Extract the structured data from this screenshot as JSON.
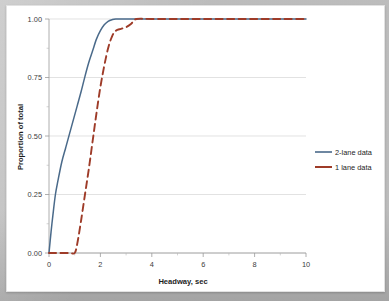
{
  "chart_data": {
    "type": "line",
    "title": "",
    "xlabel": "Headway, sec",
    "ylabel": "Proportion of total",
    "xlim": [
      0,
      10
    ],
    "ylim": [
      0,
      1.0
    ],
    "xticks": [
      "0",
      "2",
      "4",
      "6",
      "8",
      "10"
    ],
    "xtick_values": [
      0,
      2,
      4,
      6,
      8,
      10
    ],
    "yticks": [
      "0.00",
      "0.25",
      "0.50",
      "0.75",
      "1.00"
    ],
    "ytick_values": [
      0,
      0.25,
      0.5,
      0.75,
      1.0
    ],
    "grid": "horizontal",
    "legend_position": "right",
    "colors": {
      "series_2lane": "#4a6a8a",
      "series_1lane": "#9e3b28",
      "gridline": "#d6d6d6",
      "axis": "#9a9a9a",
      "plot_background": "#ffffff",
      "page_background": "#bcbcbc"
    },
    "series": [
      {
        "name": "2-lane data",
        "style": "solid",
        "color": "#4a6a8a",
        "x": [
          0.0,
          0.08,
          0.15,
          0.25,
          0.35,
          0.5,
          0.65,
          0.8,
          0.95,
          1.1,
          1.25,
          1.4,
          1.55,
          1.7,
          1.85,
          2.0,
          2.15,
          2.3,
          2.45,
          2.6,
          3.0,
          3.5,
          4.0,
          5.0,
          6.0,
          7.0,
          8.0,
          9.0,
          10.0
        ],
        "y": [
          0.0,
          0.09,
          0.16,
          0.25,
          0.31,
          0.39,
          0.45,
          0.51,
          0.57,
          0.63,
          0.69,
          0.755,
          0.815,
          0.865,
          0.915,
          0.95,
          0.975,
          0.99,
          0.997,
          1.0,
          1.0,
          1.0,
          1.0,
          1.0,
          1.0,
          1.0,
          1.0,
          1.0,
          1.0
        ]
      },
      {
        "name": "1 lane data",
        "style": "dashed",
        "color": "#9e3b28",
        "x": [
          0.0,
          0.4,
          0.8,
          1.0,
          1.1,
          1.25,
          1.4,
          1.55,
          1.7,
          1.85,
          2.0,
          2.15,
          2.3,
          2.45,
          2.6,
          2.8,
          3.0,
          3.2,
          3.4,
          4.0,
          5.0,
          6.0,
          7.0,
          8.0,
          9.0,
          10.0
        ],
        "y": [
          0.0,
          0.0,
          0.0,
          0.0,
          0.04,
          0.14,
          0.25,
          0.36,
          0.48,
          0.6,
          0.71,
          0.8,
          0.875,
          0.925,
          0.95,
          0.958,
          0.965,
          0.98,
          1.0,
          1.0,
          1.0,
          1.0,
          1.0,
          1.0,
          1.0,
          1.0
        ]
      }
    ],
    "legend": [
      {
        "label": "2-lane data",
        "color": "#4a6a8a",
        "style": "solid"
      },
      {
        "label": "1 lane data",
        "color": "#9e3b28",
        "style": "dashed"
      }
    ]
  }
}
